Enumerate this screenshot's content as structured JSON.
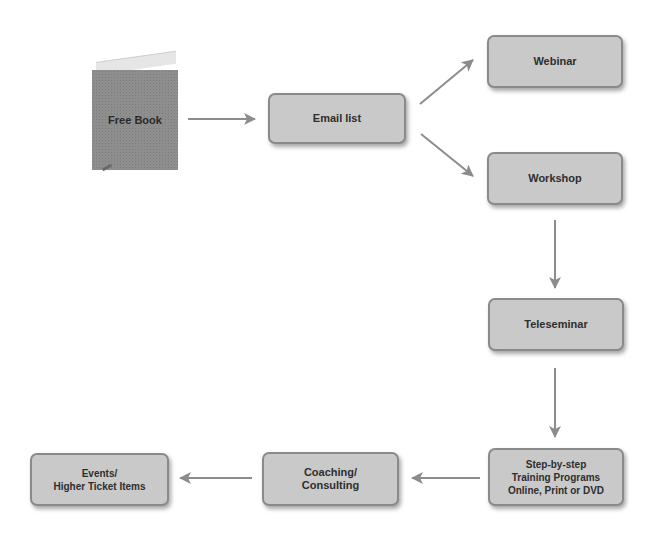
{
  "diagram": {
    "type": "flowchart",
    "colors": {
      "node_fill": "#c9c9c9",
      "node_border": "#8a8a8a",
      "arrow": "#8c8c8c",
      "text": "#2e2e2e"
    },
    "nodes": {
      "free_book": {
        "label": "Free Book",
        "shape": "book"
      },
      "email_list": {
        "label": "Email list"
      },
      "webinar": {
        "label": "Webinar"
      },
      "workshop": {
        "label": "Workshop"
      },
      "teleseminar": {
        "label": "Teleseminar"
      },
      "training": {
        "lines": [
          "Step-by-step",
          "Training Programs",
          "Online, Print or DVD"
        ]
      },
      "coaching": {
        "lines": [
          "Coaching/",
          "Consulting"
        ]
      },
      "events": {
        "lines": [
          "Events/",
          "Higher Ticket Items"
        ]
      }
    },
    "edges": [
      {
        "from": "free_book",
        "to": "email_list"
      },
      {
        "from": "email_list",
        "to": "webinar"
      },
      {
        "from": "email_list",
        "to": "workshop"
      },
      {
        "from": "workshop",
        "to": "teleseminar"
      },
      {
        "from": "teleseminar",
        "to": "training"
      },
      {
        "from": "training",
        "to": "coaching"
      },
      {
        "from": "coaching",
        "to": "events"
      }
    ]
  }
}
